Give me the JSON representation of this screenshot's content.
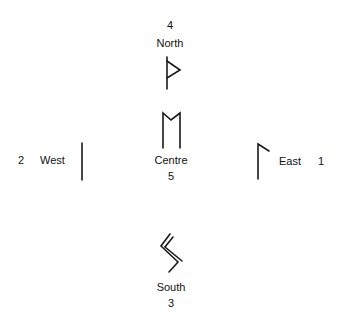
{
  "diagram": {
    "directions": {
      "north": {
        "number": "4",
        "label": "North",
        "glyph": "wunjo-rune-icon"
      },
      "centre": {
        "number": "5",
        "label": "Centre",
        "glyph": "mannaz-rune-icon"
      },
      "west": {
        "number": "2",
        "label": "West",
        "glyph": "isa-rune-icon"
      },
      "east": {
        "number": "1",
        "label": "East",
        "glyph": "laguz-rune-icon"
      },
      "south": {
        "number": "3",
        "label": "South",
        "glyph": "sowilo-rune-icon"
      }
    },
    "stroke_color": "#1a1a1a"
  }
}
